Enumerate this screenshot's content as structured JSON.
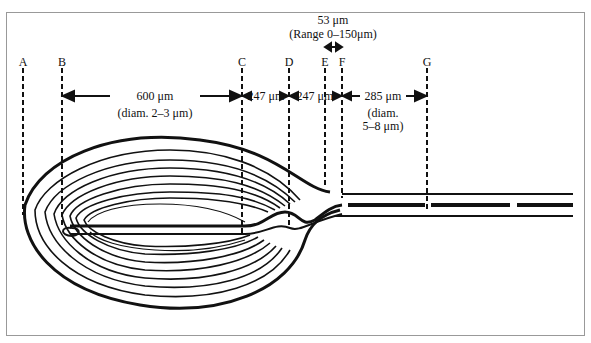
{
  "diagram": {
    "markers": [
      {
        "id": "A",
        "label": "A",
        "x": 23
      },
      {
        "id": "B",
        "label": "B",
        "x": 62
      },
      {
        "id": "C",
        "label": "C",
        "x": 242
      },
      {
        "id": "D",
        "label": "D",
        "x": 289
      },
      {
        "id": "E",
        "label": "E",
        "x": 325
      },
      {
        "id": "F",
        "label": "F",
        "x": 342
      },
      {
        "id": "G",
        "label": "G",
        "x": 427
      }
    ],
    "segments": [
      {
        "from": "B",
        "to": "C",
        "length": "600 μm",
        "diameter": "(diam. 2–3 μm)"
      },
      {
        "from": "C",
        "to": "D",
        "length": "247 μm"
      },
      {
        "from": "D",
        "to": "F",
        "length": "247 μm"
      },
      {
        "from": "F",
        "to": "G",
        "length": "285 μm",
        "diameter_line1": "(diam.",
        "diameter_line2": "5–8 μm)"
      }
    ],
    "top_annotation": {
      "length": "53 μm",
      "range": "(Range 0–150μm)"
    }
  }
}
